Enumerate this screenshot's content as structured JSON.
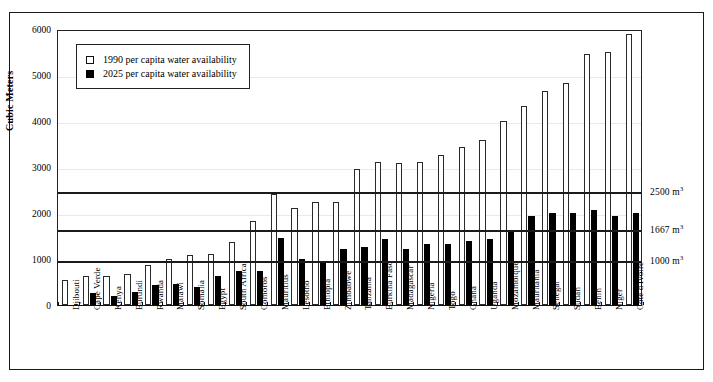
{
  "chart_data": {
    "type": "bar",
    "title": "",
    "xlabel": "",
    "ylabel": "Cubic Meters",
    "ylim": [
      0,
      6000
    ],
    "yticks": [
      0,
      1000,
      2000,
      3000,
      4000,
      5000,
      6000
    ],
    "grid": true,
    "legend_position": "top-left",
    "categories": [
      "Djibouti",
      "Cape Verde",
      "Kenya",
      "Burundi",
      "Rwanda",
      "Malawi",
      "Somalia",
      "Egypt",
      "South Africa",
      "Comoros",
      "Mauritius",
      "Lesotho",
      "Ethiopia",
      "Zimbabwe",
      "Tanzania",
      "Burkina Faso",
      "Madagascar",
      "Nigeria",
      "Togo",
      "Ghana",
      "Uganda",
      "Mozambique",
      "Mauritania",
      "Senegal",
      "Sudan",
      "Benin",
      "Niger",
      "Cote d'Ivoire"
    ],
    "series": [
      {
        "name": "1990 per capita water availability",
        "color": "#ffffff",
        "edgecolor": "#2a2a2a",
        "values": [
          550,
          630,
          640,
          680,
          880,
          1000,
          1090,
          1110,
          1380,
          1830,
          2420,
          2110,
          2250,
          2250,
          2950,
          3100,
          3090,
          3110,
          3270,
          3430,
          3590,
          4000,
          4330,
          4660,
          4820,
          5450,
          5510,
          5900
        ]
      },
      {
        "name": "2025 per capita water availability",
        "color": "#000000",
        "edgecolor": "#000000",
        "values": [
          null,
          270,
          190,
          280,
          440,
          450,
          390,
          620,
          750,
          730,
          1450,
          990,
          910,
          1210,
          1270,
          1430,
          1210,
          1330,
          1330,
          1390,
          1440,
          1600,
          1930,
          2010,
          2000,
          2070,
          1940,
          2010
        ]
      }
    ],
    "threshold_lines": [
      {
        "value": 2500,
        "label": "2500 m",
        "sup": "3"
      },
      {
        "value": 1667,
        "label": "1667 m",
        "sup": "3"
      },
      {
        "value": 1000,
        "label": "1000 m",
        "sup": "3"
      }
    ]
  }
}
